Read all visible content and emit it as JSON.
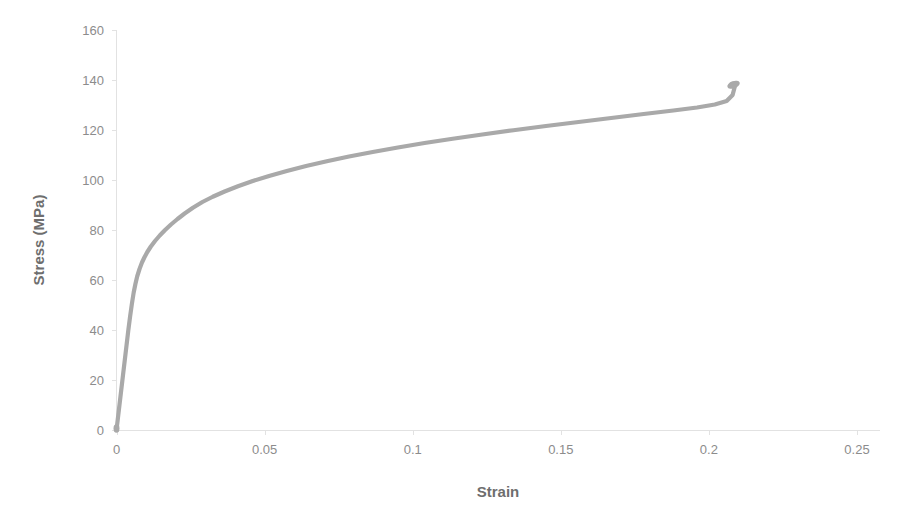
{
  "chart_data": {
    "type": "line",
    "title": "",
    "xlabel": "Strain",
    "ylabel": "Stress (MPa)",
    "xlim": [
      0,
      0.25
    ],
    "ylim": [
      0,
      160
    ],
    "grid": false,
    "legend": false,
    "legend_position": "none",
    "series_color": "#a9a9a9",
    "axis_color": "#e2e2e2",
    "tick_label_color": "#8c8c8c",
    "axis_title_color": "#6e6e6e",
    "xticks": [
      "0",
      "0.05",
      "0.1",
      "0.15",
      "0.2",
      "0.25"
    ],
    "xtick_values": [
      0,
      0.05,
      0.1,
      0.15,
      0.2,
      0.25
    ],
    "yticks": [
      "0",
      "20",
      "40",
      "60",
      "80",
      "100",
      "120",
      "140",
      "160"
    ],
    "ytick_values": [
      0,
      20,
      40,
      60,
      80,
      100,
      120,
      140,
      160
    ],
    "series": [
      {
        "name": "Stress-Strain",
        "x": [
          0.0,
          0.0005,
          0.001,
          0.0016,
          0.0022,
          0.0028,
          0.0034,
          0.004,
          0.0046,
          0.0052,
          0.0058,
          0.0064,
          0.007,
          0.0078,
          0.0086,
          0.0094,
          0.0104,
          0.0116,
          0.013,
          0.0146,
          0.0164,
          0.0184,
          0.0206,
          0.023,
          0.0258,
          0.029,
          0.0325,
          0.0365,
          0.041,
          0.046,
          0.0515,
          0.0575,
          0.064,
          0.071,
          0.0785,
          0.0865,
          0.095,
          0.104,
          0.1135,
          0.1235,
          0.134,
          0.145,
          0.156,
          0.167,
          0.178,
          0.188,
          0.196,
          0.202,
          0.206,
          0.208,
          0.209
        ],
        "y": [
          0.0,
          5.0,
          10.0,
          16.0,
          22.0,
          28.0,
          34.0,
          40.0,
          45.5,
          50.5,
          55.0,
          58.5,
          61.5,
          64.5,
          67.0,
          69.0,
          71.2,
          73.4,
          75.6,
          77.8,
          80.0,
          82.2,
          84.4,
          86.6,
          88.9,
          91.2,
          93.3,
          95.4,
          97.5,
          99.6,
          101.6,
          103.6,
          105.6,
          107.5,
          109.4,
          111.2,
          113.0,
          114.8,
          116.5,
          118.2,
          119.9,
          121.6,
          123.2,
          124.8,
          126.4,
          127.8,
          129.0,
          130.2,
          131.6,
          134.0,
          138.5
        ]
      }
    ],
    "annotations": []
  },
  "axes": {
    "x_title": "Strain",
    "y_title": "Stress (MPa)"
  }
}
